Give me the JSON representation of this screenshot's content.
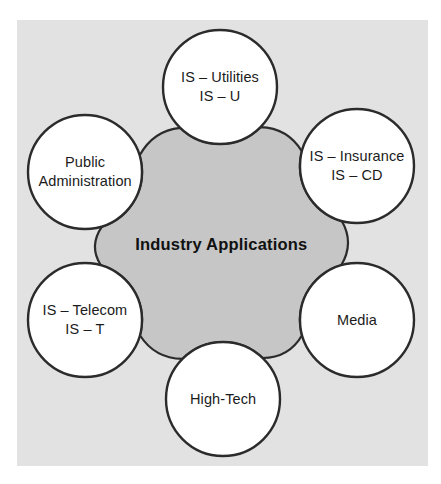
{
  "diagram": {
    "title": "Industry Applications",
    "hub": {
      "line1": "Industry",
      "line2": "Applications",
      "fill": "#c6c6c6",
      "stroke": "#2b2b2b"
    },
    "panel": {
      "fill": "#e2e2e2"
    },
    "node_style": {
      "fill": "#ffffff",
      "stroke": "#2b2b2b",
      "stroke_width": 2.4,
      "radius": 57
    },
    "nodes": [
      {
        "id": "is-utilities",
        "name": "IS – Utilities",
        "line1": "IS – Utilities",
        "line2": "IS – U",
        "cx": 220,
        "cy": 87
      },
      {
        "id": "is-insurance",
        "name": "IS – Insurance",
        "line1": "IS – Insurance",
        "line2": "IS – CD",
        "cx": 357,
        "cy": 166
      },
      {
        "id": "media",
        "name": "Media",
        "line1": "Media",
        "line2": "",
        "cx": 357,
        "cy": 320
      },
      {
        "id": "high-tech",
        "name": "High-Tech",
        "line1": "High-Tech",
        "line2": "",
        "cx": 223,
        "cy": 399
      },
      {
        "id": "is-telecom",
        "name": "IS – Telecom",
        "line1": "IS – Telecom",
        "line2": "IS – T",
        "cx": 85,
        "cy": 320
      },
      {
        "id": "public-administration",
        "name": "Public Administration",
        "line1": "Public",
        "line2": "Administration",
        "cx": 85,
        "cy": 172
      }
    ],
    "connectors": [
      {
        "from": "public-administration",
        "to": "is-utilities"
      },
      {
        "from": "is-utilities",
        "to": "is-insurance"
      },
      {
        "from": "is-insurance",
        "to": "media"
      },
      {
        "from": "media",
        "to": "high-tech"
      },
      {
        "from": "high-tech",
        "to": "is-telecom"
      },
      {
        "from": "is-telecom",
        "to": "public-administration"
      }
    ]
  }
}
